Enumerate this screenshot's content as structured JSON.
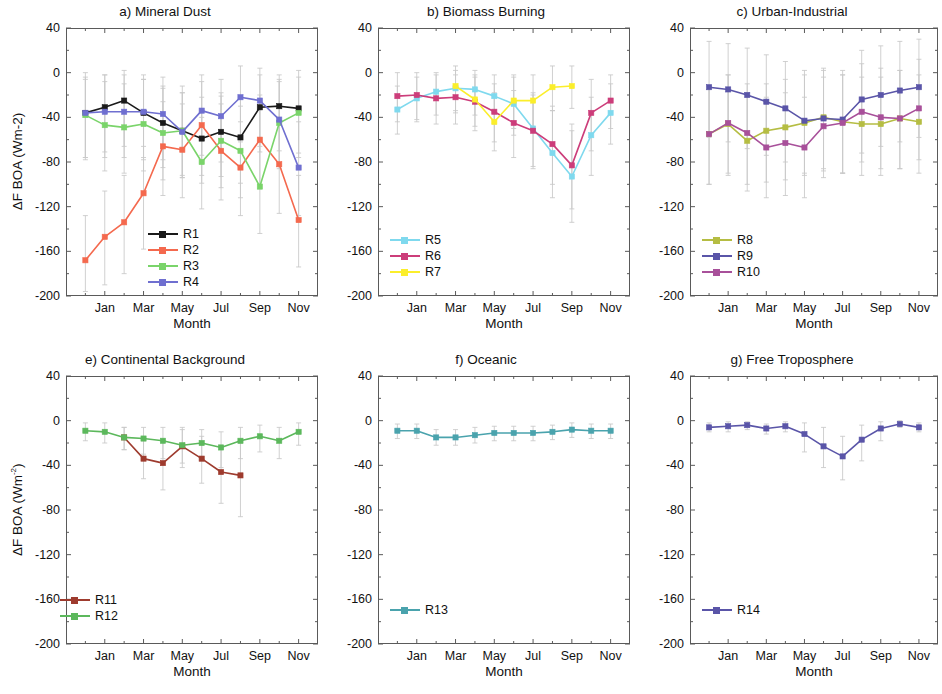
{
  "figure": {
    "xlabel": "Month",
    "ylabel_top": "ΔF BOA (Wm-2)",
    "ylabel_bottom": "ΔF BOA (Wm",
    "ylabel_bottom_sup": "-2",
    "ylabel_bottom_tail": ")",
    "ytick_labels": [
      "40",
      "0",
      "-40",
      "-80",
      "-120",
      "-160",
      "-200"
    ],
    "xtick_labels": [
      "Jan",
      "Mar",
      "May",
      "Jul",
      "Sep",
      "Nov"
    ]
  },
  "colors": {
    "R1": "#1a1a1a",
    "R2": "#f4694e",
    "R3": "#7ad46a",
    "R4": "#6f6fd0",
    "R5": "#7fd9ee",
    "R6": "#cc3d7a",
    "R7": "#fbee2b",
    "R8": "#b5bd43",
    "R9": "#5a55a8",
    "R10": "#a8509a",
    "R11": "#9e3b2e",
    "R12": "#5cb85c",
    "R13": "#4aa3ad",
    "R14": "#5a55a8",
    "errorbar": "#c9c9c9",
    "axis": "#5a5a5a"
  },
  "chart_data": [
    {
      "id": "a",
      "type": "line",
      "title": "a)  Mineral Dust",
      "xlabel": "Month",
      "ylabel": "ΔF BOA (Wm-2)",
      "ylim": [
        -200,
        40
      ],
      "yticks": [
        40,
        0,
        -40,
        -80,
        -120,
        -160,
        -200
      ],
      "x": [
        1,
        2,
        3,
        4,
        5,
        6,
        7,
        8,
        9,
        10,
        11,
        12
      ],
      "xticks": [
        2,
        4,
        6,
        8,
        10,
        12
      ],
      "xticklabels": [
        "Jan",
        "Mar",
        "May",
        "Jul",
        "Sep",
        "Nov"
      ],
      "grid": false,
      "legend_position": "lower-center",
      "series": [
        {
          "name": "R1",
          "values": [
            -36,
            -31,
            -25,
            -36,
            -45,
            -52,
            -59,
            -53,
            -58,
            -31,
            -30,
            -32
          ],
          "err_low": [
            -76,
            -71,
            -66,
            -78,
            -85,
            -92,
            -99,
            -93,
            -99,
            -71,
            -70,
            -72
          ],
          "err_high": [
            -6,
            -2,
            2,
            -6,
            -12,
            -18,
            -22,
            -18,
            -22,
            -2,
            -2,
            -4
          ]
        },
        {
          "name": "R2",
          "values": [
            -168,
            -147,
            -134,
            -108,
            -66,
            -69,
            -47,
            -70,
            -85,
            -60,
            -82,
            -132
          ],
          "err_low": [
            -196,
            -190,
            -180,
            -158,
            -110,
            -112,
            -92,
            -114,
            -128,
            -104,
            -126,
            -174
          ],
          "err_high": [
            -128,
            -106,
            -92,
            -66,
            -26,
            -28,
            -8,
            -28,
            -44,
            -20,
            -42,
            -92
          ]
        },
        {
          "name": "R3",
          "values": [
            -38,
            -47,
            -49,
            -46,
            -54,
            -52,
            -80,
            -61,
            -70,
            -102,
            -45,
            -36
          ],
          "err_low": [
            -78,
            -88,
            -90,
            -88,
            -96,
            -94,
            -122,
            -103,
            -112,
            -144,
            -86,
            -76
          ],
          "err_high": [
            0,
            -8,
            -10,
            -6,
            -14,
            -12,
            -40,
            -21,
            -30,
            -62,
            -6,
            2
          ]
        },
        {
          "name": "R4",
          "values": [
            -36,
            -35,
            -35,
            -35,
            -37,
            -53,
            -34,
            -39,
            -22,
            -25,
            -42,
            -85
          ],
          "err_low": [
            -76,
            -76,
            -76,
            -76,
            -78,
            -94,
            -74,
            -80,
            -62,
            -66,
            -84,
            -128
          ],
          "err_high": [
            -4,
            -2,
            -2,
            -2,
            -4,
            -18,
            -2,
            -6,
            6,
            4,
            -8,
            -44
          ]
        }
      ]
    },
    {
      "id": "b",
      "type": "line",
      "title": "b) Biomass Burning",
      "xlabel": "Month",
      "ylabel": "",
      "ylim": [
        -200,
        40
      ],
      "yticks": [
        40,
        0,
        -40,
        -80,
        -120,
        -160,
        -200
      ],
      "x": [
        1,
        2,
        3,
        4,
        5,
        6,
        7,
        8,
        9,
        10,
        11,
        12
      ],
      "xticks": [
        2,
        4,
        6,
        8,
        10,
        12
      ],
      "xticklabels": [
        "Jan",
        "Mar",
        "May",
        "Jul",
        "Sep",
        "Nov"
      ],
      "grid": false,
      "legend_position": "lower-left",
      "series": [
        {
          "name": "R5",
          "values": [
            -33,
            -23,
            -17,
            -14,
            -15,
            -21,
            -28,
            -50,
            -72,
            -93,
            -56,
            -36
          ],
          "err_low": [
            -55,
            -44,
            -38,
            -36,
            -38,
            -46,
            -56,
            -84,
            -112,
            -134,
            -92,
            -64
          ],
          "err_high": [
            -12,
            -4,
            0,
            2,
            2,
            -2,
            -4,
            -18,
            -34,
            -52,
            -22,
            -10
          ]
        },
        {
          "name": "R6",
          "values": [
            -21,
            -20,
            -23,
            -22,
            -26,
            -35,
            -45,
            -52,
            -64,
            -83,
            -36,
            -25
          ],
          "err_low": [
            -44,
            -42,
            -46,
            -46,
            -52,
            -62,
            -76,
            -86,
            -100,
            -122,
            -70,
            -50
          ],
          "err_high": [
            0,
            0,
            -2,
            -2,
            -4,
            -10,
            -16,
            -20,
            -30,
            -46,
            -6,
            -2
          ]
        },
        {
          "name": "R7",
          "values": [
            null,
            null,
            null,
            -12,
            -24,
            -44,
            -25,
            -25,
            -13,
            -12,
            null,
            null
          ],
          "err_low": [
            null,
            null,
            null,
            -34,
            -48,
            -70,
            -50,
            -50,
            -34,
            -32,
            null,
            null
          ],
          "err_high": [
            null,
            null,
            null,
            6,
            -2,
            -18,
            -2,
            -2,
            6,
            6,
            null,
            null
          ]
        }
      ]
    },
    {
      "id": "c",
      "type": "line",
      "title": "c) Urban-Industrial",
      "xlabel": "Month",
      "ylabel": "",
      "ylim": [
        -200,
        40
      ],
      "yticks": [
        40,
        0,
        -40,
        -80,
        -120,
        -160,
        -200
      ],
      "x": [
        1,
        2,
        3,
        4,
        5,
        6,
        7,
        8,
        9,
        10,
        11,
        12
      ],
      "xticks": [
        2,
        4,
        6,
        8,
        10,
        12
      ],
      "xticklabels": [
        "Jan",
        "Mar",
        "May",
        "Jul",
        "Sep",
        "Nov"
      ],
      "grid": false,
      "legend_position": "lower-left",
      "series": [
        {
          "name": "R8",
          "values": [
            -55,
            -46,
            -61,
            -52,
            -49,
            -45,
            -40,
            -44,
            -46,
            -46,
            -41,
            -44
          ],
          "err_low": [
            -100,
            -92,
            -106,
            -98,
            -96,
            -92,
            -86,
            -90,
            -92,
            -92,
            -86,
            -90
          ],
          "err_high": [
            -12,
            -2,
            -18,
            -10,
            -6,
            -2,
            2,
            -2,
            -4,
            -4,
            2,
            -2
          ]
        },
        {
          "name": "R9",
          "values": [
            -13,
            -15,
            -20,
            -26,
            -32,
            -43,
            -41,
            -42,
            -24,
            -20,
            -16,
            -13
          ],
          "err_low": [
            -58,
            -62,
            -68,
            -74,
            -80,
            -90,
            -88,
            -90,
            -72,
            -66,
            -62,
            -58
          ],
          "err_high": [
            28,
            26,
            22,
            16,
            10,
            2,
            4,
            2,
            20,
            24,
            28,
            30
          ]
        },
        {
          "name": "R10",
          "values": [
            -55,
            -45,
            -54,
            -67,
            -63,
            -67,
            -48,
            -45,
            -35,
            -40,
            -41,
            -32
          ],
          "err_low": [
            -100,
            -90,
            -100,
            -112,
            -110,
            -112,
            -94,
            -90,
            -80,
            -86,
            -86,
            -78
          ],
          "err_high": [
            -12,
            -2,
            -10,
            -22,
            -18,
            -22,
            -4,
            -2,
            8,
            4,
            2,
            12
          ]
        }
      ]
    },
    {
      "id": "e",
      "type": "line",
      "title": "e) Continental Background",
      "xlabel": "Month",
      "ylabel": "ΔF BOA (Wm-2)",
      "ylim": [
        -200,
        40
      ],
      "yticks": [
        40,
        0,
        -40,
        -80,
        -120,
        -160,
        -200
      ],
      "x": [
        1,
        2,
        3,
        4,
        5,
        6,
        7,
        8,
        9,
        10,
        11,
        12
      ],
      "xticks": [
        2,
        4,
        6,
        8,
        10,
        12
      ],
      "xticklabels": [
        "Jan",
        "Mar",
        "May",
        "Jul",
        "Sep",
        "Nov"
      ],
      "grid": false,
      "legend_position": "lower-left",
      "series": [
        {
          "name": "R11",
          "values": [
            null,
            null,
            -15,
            -34,
            -38,
            -23,
            -34,
            -46,
            -49,
            null,
            null,
            null
          ],
          "err_low": [
            null,
            null,
            -26,
            -52,
            -62,
            -42,
            -56,
            -74,
            -86,
            null,
            null,
            null
          ],
          "err_high": [
            null,
            null,
            -6,
            -18,
            -18,
            -6,
            -14,
            -22,
            -20,
            null,
            null,
            null
          ]
        },
        {
          "name": "R12",
          "values": [
            -9,
            -10,
            -15,
            -16,
            -18,
            -22,
            -20,
            -24,
            -18,
            -14,
            -18,
            -10
          ],
          "err_low": [
            -18,
            -20,
            -26,
            -30,
            -34,
            -38,
            -36,
            -42,
            -34,
            -28,
            -34,
            -22
          ],
          "err_high": [
            -2,
            -2,
            -6,
            -6,
            -6,
            -8,
            -8,
            -10,
            -6,
            -4,
            -6,
            -2
          ]
        }
      ]
    },
    {
      "id": "f",
      "type": "line",
      "title": "f) Oceanic",
      "xlabel": "Month",
      "ylabel": "",
      "ylim": [
        -200,
        40
      ],
      "yticks": [
        40,
        0,
        -40,
        -80,
        -120,
        -160,
        -200
      ],
      "x": [
        1,
        2,
        3,
        4,
        5,
        6,
        7,
        8,
        9,
        10,
        11,
        12
      ],
      "xticks": [
        2,
        4,
        6,
        8,
        10,
        12
      ],
      "xticklabels": [
        "Jan",
        "Mar",
        "May",
        "Jul",
        "Sep",
        "Nov"
      ],
      "grid": false,
      "legend_position": "lower-left",
      "series": [
        {
          "name": "R13",
          "values": [
            -9,
            -9,
            -15,
            -15,
            -13,
            -11,
            -11,
            -11,
            -10,
            -8,
            -9,
            -9
          ],
          "err_low": [
            -16,
            -16,
            -22,
            -22,
            -20,
            -18,
            -18,
            -18,
            -17,
            -15,
            -16,
            -16
          ],
          "err_high": [
            -3,
            -3,
            -8,
            -8,
            -6,
            -5,
            -5,
            -5,
            -4,
            -2,
            -3,
            -3
          ]
        }
      ]
    },
    {
      "id": "g",
      "type": "line",
      "title": "g) Free Troposphere",
      "xlabel": "Month",
      "ylabel": "",
      "ylim": [
        -200,
        40
      ],
      "yticks": [
        40,
        0,
        -40,
        -80,
        -120,
        -160,
        -200
      ],
      "x": [
        1,
        2,
        3,
        4,
        5,
        6,
        7,
        8,
        9,
        10,
        11,
        12
      ],
      "xticks": [
        2,
        4,
        6,
        8,
        10,
        12
      ],
      "xticklabels": [
        "Jan",
        "Mar",
        "May",
        "Jul",
        "Sep",
        "Nov"
      ],
      "grid": false,
      "legend_position": "lower-left",
      "series": [
        {
          "name": "R14",
          "values": [
            -6,
            -5,
            -4,
            -7,
            -5,
            -12,
            -23,
            -32,
            -17,
            -7,
            -3,
            -6
          ],
          "err_low": [
            -10,
            -10,
            -8,
            -12,
            -10,
            -28,
            -42,
            -53,
            -36,
            -18,
            -6,
            -10
          ],
          "err_high": [
            -2,
            -1,
            -1,
            -3,
            -1,
            -2,
            -6,
            -14,
            -4,
            -1,
            0,
            -2
          ]
        }
      ]
    }
  ],
  "legends": [
    {
      "panel": "a",
      "items": [
        {
          "label": "R1"
        },
        {
          "label": "R2"
        },
        {
          "label": "R3"
        },
        {
          "label": "R4"
        }
      ]
    },
    {
      "panel": "b",
      "items": [
        {
          "label": "R5"
        },
        {
          "label": "R6"
        },
        {
          "label": "R7"
        }
      ]
    },
    {
      "panel": "c",
      "items": [
        {
          "label": "R8"
        },
        {
          "label": "R9"
        },
        {
          "label": "R10"
        }
      ]
    },
    {
      "panel": "e",
      "items": [
        {
          "label": "R11"
        },
        {
          "label": "R12"
        }
      ]
    },
    {
      "panel": "f",
      "items": [
        {
          "label": "R13"
        }
      ]
    },
    {
      "panel": "g",
      "items": [
        {
          "label": "R14"
        }
      ]
    }
  ]
}
